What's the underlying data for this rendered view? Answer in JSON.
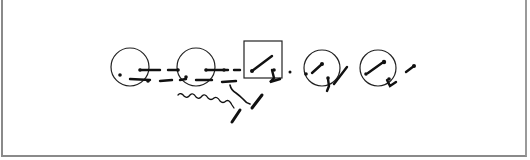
{
  "figure": {
    "elements": [
      {
        "type": "circle",
        "label": ""
      },
      {
        "type": "circle",
        "label": ""
      },
      {
        "type": "square",
        "label": ""
      },
      {
        "type": "circle",
        "label": ""
      },
      {
        "type": "circle",
        "label": ""
      }
    ],
    "colors": {
      "ink": "#111111",
      "border": "#8a8a8a",
      "background": "#ffffff"
    }
  }
}
